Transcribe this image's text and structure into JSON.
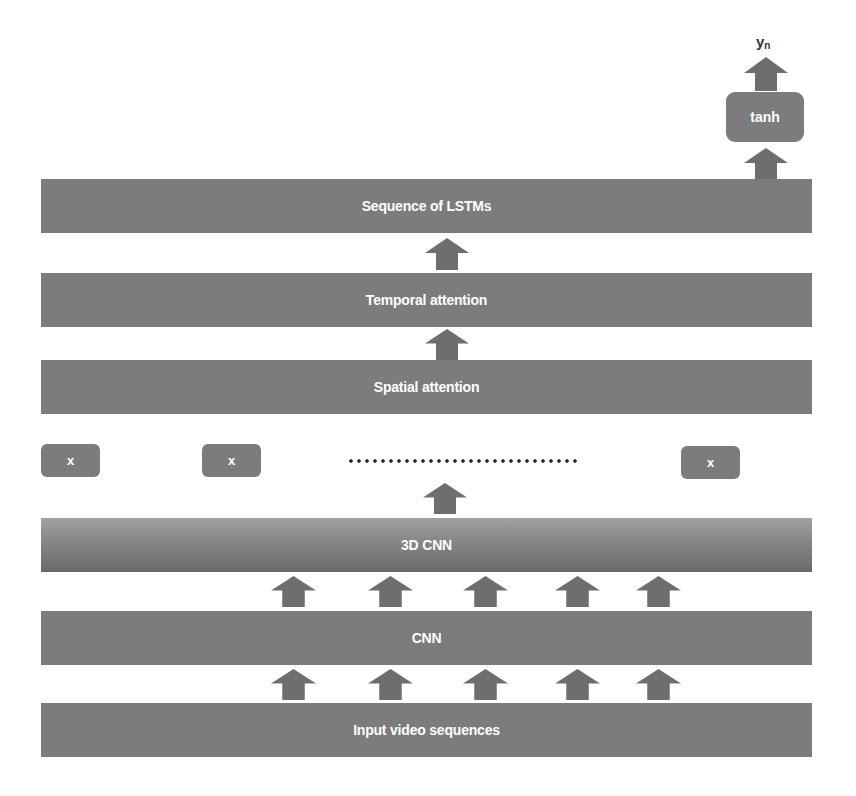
{
  "diagram": {
    "output_label": {
      "base": "y",
      "subscript": "n"
    },
    "activation": {
      "label": "tanh"
    },
    "layers": [
      {
        "id": "lstm",
        "label": "Sequence of LSTMs"
      },
      {
        "id": "temporal",
        "label": "Temporal attention"
      },
      {
        "id": "spatial",
        "label": "Spatial attention"
      },
      {
        "id": "cnn3d",
        "label": "3D CNN"
      },
      {
        "id": "cnn",
        "label": "CNN"
      },
      {
        "id": "input",
        "label": "Input video sequences"
      }
    ],
    "multiply_nodes": [
      {
        "label": "x"
      },
      {
        "label": "x"
      },
      {
        "label": "x"
      }
    ],
    "ellipsis": "dotted-line",
    "colors": {
      "block": "#7c7c7c",
      "arrow": "#6e6e6e",
      "text": "#ffffff",
      "background": "#ffffff"
    },
    "parallel_arrow_count": 5
  }
}
